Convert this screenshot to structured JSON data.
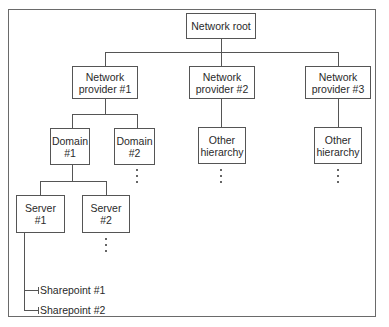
{
  "diagram": {
    "root": {
      "label": "Network root"
    },
    "providers": [
      {
        "label": "Network\nprovider #1"
      },
      {
        "label": "Network\nprovider #2"
      },
      {
        "label": "Network\nprovider #3"
      }
    ],
    "domains": [
      {
        "label": "Domain\n#1"
      },
      {
        "label": "Domain\n#2"
      }
    ],
    "other_hierarchies": [
      {
        "label": "Other\nhierarchy"
      },
      {
        "label": "Other\nhierarchy"
      }
    ],
    "servers": [
      {
        "label": "Server\n#1"
      },
      {
        "label": "Server\n#2"
      }
    ],
    "sharepoints": [
      {
        "label": "Sharepoint #1"
      },
      {
        "label": "Sharepoint #2"
      }
    ],
    "colors": {
      "line": "#555555",
      "frame": "#6a6a6a",
      "background": "#ffffff"
    }
  }
}
